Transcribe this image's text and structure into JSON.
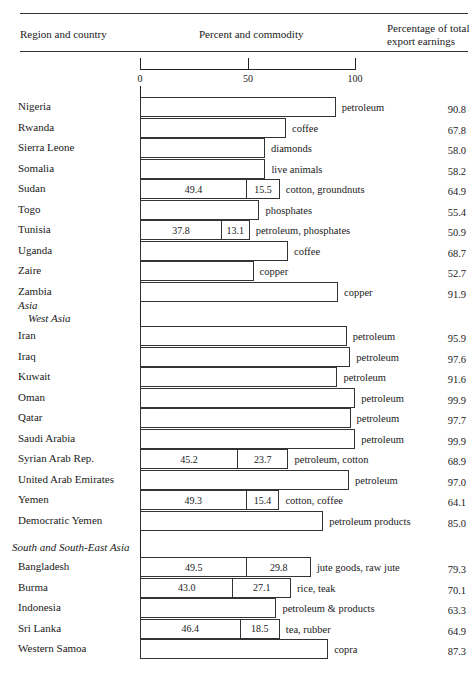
{
  "header": {
    "col1": "Region and country",
    "col2": "Percent and commodity",
    "col3_line1": "Percentage of total",
    "col3_line2": "export earnings"
  },
  "axis": {
    "ticks": [
      "0",
      "50",
      "100"
    ]
  },
  "sections": {
    "asia": "Asia",
    "west_asia": "West Asia",
    "south_east_asia": "South and South-East Asia"
  },
  "chart_data": {
    "type": "bar",
    "xlabel": "Percent",
    "ylabel": "Region and country",
    "xlim": [
      0,
      100
    ],
    "xticks": [
      0,
      50,
      100
    ],
    "rows": [
      {
        "region": "Africa",
        "country": "Nigeria",
        "segments": [
          90.8
        ],
        "commodity": "petroleum",
        "total": "90.8"
      },
      {
        "region": "Africa",
        "country": "Rwanda",
        "segments": [
          67.8
        ],
        "commodity": "coffee",
        "total": "67.8"
      },
      {
        "region": "Africa",
        "country": "Sierra Leone",
        "segments": [
          58.0
        ],
        "commodity": "diamonds",
        "total": "58.0"
      },
      {
        "region": "Africa",
        "country": "Somalia",
        "segments": [
          58.2
        ],
        "commodity": "live animals",
        "total": "58.2"
      },
      {
        "region": "Africa",
        "country": "Sudan",
        "segments": [
          49.4,
          15.5
        ],
        "segment_labels": [
          "49.4",
          "15.5"
        ],
        "commodity": "cotton, groundnuts",
        "total": "64.9"
      },
      {
        "region": "Africa",
        "country": "Togo",
        "segments": [
          55.4
        ],
        "commodity": "phosphates",
        "total": "55.4"
      },
      {
        "region": "Africa",
        "country": "Tunisia",
        "segments": [
          37.8,
          13.1
        ],
        "segment_labels": [
          "37.8",
          "13.1"
        ],
        "commodity": "petroleum, phosphates",
        "total": "50.9"
      },
      {
        "region": "Africa",
        "country": "Uganda",
        "segments": [
          68.7
        ],
        "commodity": "coffee",
        "total": "68.7"
      },
      {
        "region": "Africa",
        "country": "Zaire",
        "segments": [
          52.7
        ],
        "commodity": "copper",
        "total": "52.7"
      },
      {
        "region": "Africa",
        "country": "Zambia",
        "segments": [
          91.9
        ],
        "commodity": "copper",
        "total": "91.9"
      },
      {
        "region": "West Asia",
        "country": "Iran",
        "segments": [
          95.9
        ],
        "commodity": "petroleum",
        "total": "95.9"
      },
      {
        "region": "West Asia",
        "country": "Iraq",
        "segments": [
          97.6
        ],
        "commodity": "petroleum",
        "total": "97.6"
      },
      {
        "region": "West Asia",
        "country": "Kuwait",
        "segments": [
          91.6
        ],
        "commodity": "petroleum",
        "total": "91.6"
      },
      {
        "region": "West Asia",
        "country": "Oman",
        "segments": [
          99.9
        ],
        "commodity": "petroleum",
        "total": "99.9"
      },
      {
        "region": "West Asia",
        "country": "Qatar",
        "segments": [
          97.7
        ],
        "commodity": "petroleum",
        "total": "97.7"
      },
      {
        "region": "West Asia",
        "country": "Saudi Arabia",
        "segments": [
          99.9
        ],
        "commodity": "petroleum",
        "total": "99.9"
      },
      {
        "region": "West Asia",
        "country": "Syrian Arab Rep.",
        "segments": [
          45.2,
          23.7
        ],
        "segment_labels": [
          "45.2",
          "23.7"
        ],
        "commodity": "petroleum, cotton",
        "total": "68.9"
      },
      {
        "region": "West Asia",
        "country": "United Arab Emirates",
        "segments": [
          97.0
        ],
        "commodity": "petroleum",
        "total": "97.0"
      },
      {
        "region": "West Asia",
        "country": "Yemen",
        "segments": [
          49.3,
          15.4
        ],
        "segment_labels": [
          "49.3",
          "15.4"
        ],
        "commodity": "cotton, coffee",
        "total": "64.1"
      },
      {
        "region": "West Asia",
        "country": "Democratic Yemen",
        "segments": [
          85.0
        ],
        "commodity": "petroleum products",
        "total": "85.0"
      },
      {
        "region": "South and South-East Asia",
        "country": "Bangladesh",
        "segments": [
          49.5,
          29.8
        ],
        "segment_labels": [
          "49.5",
          "29.8"
        ],
        "commodity": "jute goods, raw jute",
        "total": "79.3"
      },
      {
        "region": "South and South-East Asia",
        "country": "Burma",
        "segments": [
          43.0,
          27.1
        ],
        "segment_labels": [
          "43.0",
          "27.1"
        ],
        "commodity": "rice, teak",
        "total": "70.1"
      },
      {
        "region": "South and South-East Asia",
        "country": "Indonesia",
        "segments": [
          63.3
        ],
        "commodity": "petroleum & products",
        "total": "63.3"
      },
      {
        "region": "South and South-East Asia",
        "country": "Sri Lanka",
        "segments": [
          46.4,
          18.5
        ],
        "segment_labels": [
          "46.4",
          "18.5"
        ],
        "commodity": "tea, rubber",
        "total": "64.9"
      },
      {
        "region": "South and South-East Asia",
        "country": "Western Samoa",
        "segments": [
          87.3
        ],
        "commodity": "copra",
        "total": "87.3"
      }
    ]
  }
}
